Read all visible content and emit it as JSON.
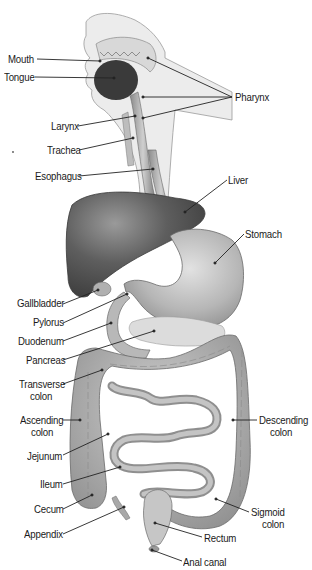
{
  "diagram": {
    "labels": [
      {
        "id": "mouth",
        "text": "Mouth",
        "x": 8,
        "y": 53,
        "align": "left",
        "line": [
          37,
          59,
          100,
          61
        ]
      },
      {
        "id": "tongue",
        "text": "Tongue",
        "x": 4,
        "y": 71,
        "align": "left",
        "line": [
          35,
          77,
          114,
          78
        ]
      },
      {
        "id": "pharynx",
        "text": "Pharynx",
        "x": 235,
        "y": 91,
        "align": "left",
        "lines": [
          [
            232,
            97,
            148,
            58
          ],
          [
            232,
            97,
            143,
            97
          ],
          [
            232,
            97,
            143,
            118
          ]
        ]
      },
      {
        "id": "larynx",
        "text": "Larynx",
        "x": 51,
        "y": 120,
        "align": "left",
        "line": [
          78,
          126,
          135,
          116
        ]
      },
      {
        "id": "trachea",
        "text": "Trachea",
        "x": 47,
        "y": 144,
        "align": "left",
        "line": [
          79,
          150,
          133,
          138
        ]
      },
      {
        "id": "esophagus",
        "text": "Esophagus",
        "x": 35,
        "y": 170,
        "align": "left",
        "line": [
          79,
          176,
          153,
          169
        ]
      },
      {
        "id": "liver",
        "text": "Liver",
        "x": 228,
        "y": 174,
        "align": "left",
        "line": [
          227,
          180,
          185,
          212
        ]
      },
      {
        "id": "stomach",
        "text": "Stomach",
        "x": 245,
        "y": 228,
        "align": "left",
        "line": [
          244,
          234,
          215,
          263
        ]
      },
      {
        "id": "gallbladder",
        "text": "Gallbladder",
        "x": 17,
        "y": 297,
        "align": "left",
        "line": [
          63,
          304,
          98,
          290
        ]
      },
      {
        "id": "pylorus",
        "text": "Pylorus",
        "x": 33,
        "y": 316,
        "align": "left",
        "line": [
          63,
          323,
          127,
          294
        ]
      },
      {
        "id": "duodenum",
        "text": "Duodenum",
        "x": 18,
        "y": 335,
        "align": "left",
        "line": [
          63,
          341,
          111,
          323
        ]
      },
      {
        "id": "pancreas",
        "text": "Pancreas",
        "x": 26,
        "y": 354,
        "align": "left",
        "line": [
          63,
          360,
          154,
          331
        ]
      },
      {
        "id": "transverse_colon",
        "text": "Transverse\ncolon",
        "x": 19,
        "y": 378,
        "align": "left",
        "line": [
          63,
          384,
          102,
          370
        ]
      },
      {
        "id": "ascending_colon",
        "text": "Ascending\ncolon",
        "x": 20,
        "y": 414,
        "align": "left",
        "line": [
          63,
          420,
          80,
          420
        ]
      },
      {
        "id": "jejunum",
        "text": "Jejunum",
        "x": 27,
        "y": 450,
        "align": "left",
        "line": [
          63,
          455,
          108,
          434
        ]
      },
      {
        "id": "ileum",
        "text": "Ileum",
        "x": 40,
        "y": 478,
        "align": "left",
        "line": [
          63,
          484,
          120,
          467
        ]
      },
      {
        "id": "cecum",
        "text": "Cecum",
        "x": 34,
        "y": 503,
        "align": "left",
        "line": [
          63,
          509,
          92,
          495
        ]
      },
      {
        "id": "appendix",
        "text": "Appendix",
        "x": 24,
        "y": 528,
        "align": "left",
        "line": [
          63,
          534,
          124,
          507
        ]
      },
      {
        "id": "descending_colon",
        "text": "Descending\ncolon",
        "x": 259,
        "y": 414,
        "align": "left",
        "line": [
          257,
          420,
          233,
          420
        ]
      },
      {
        "id": "sigmoid_colon",
        "text": "Sigmoid\ncolon",
        "x": 251,
        "y": 506,
        "align": "left",
        "line": [
          249,
          512,
          216,
          499
        ]
      },
      {
        "id": "rectum",
        "text": "Rectum",
        "x": 204,
        "y": 532,
        "align": "left",
        "line": [
          202,
          537,
          155,
          523
        ]
      },
      {
        "id": "anal_canal",
        "text": "Anal canal",
        "x": 183,
        "y": 556,
        "align": "left",
        "line": [
          182,
          561,
          152,
          550
        ]
      }
    ]
  },
  "colors": {
    "background": "#ffffff",
    "text": "#1a1a1a",
    "leader": "#222222",
    "liver": "#5e5e5e",
    "tongue": "#3a3a3a",
    "stomach": "#b4b4b4",
    "intestine": "#a8a8a8",
    "pancreas": "#d9d9d9",
    "skin": "#e6e6e6"
  }
}
